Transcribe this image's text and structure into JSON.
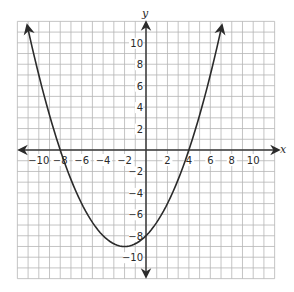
{
  "chart_data": {
    "type": "line",
    "title": "",
    "xlabel": "x",
    "ylabel": "y",
    "xlim": [
      -12,
      12
    ],
    "ylim": [
      -12,
      12
    ],
    "grid": true,
    "grid_step": 1,
    "x_ticks": [
      -10,
      -8,
      -6,
      -4,
      -2,
      2,
      4,
      6,
      8,
      10
    ],
    "y_ticks": [
      -10,
      -8,
      -6,
      -4,
      -2,
      2,
      4,
      6,
      8,
      10
    ],
    "x_tick_labels": [
      "−10",
      "−8",
      "−6",
      "−4",
      "−2",
      "2",
      "4",
      "6",
      "8",
      "10"
    ],
    "y_tick_labels": [
      "−10",
      "−8",
      "−6",
      "−4",
      "−2",
      "2",
      "4",
      "6",
      "8",
      "10"
    ],
    "series": [
      {
        "name": "parabola",
        "equation": "y = 0.25(x + 8)(x - 4)",
        "x_intercepts": [
          -8,
          4
        ],
        "y_intercept": -8,
        "vertex": [
          -2,
          -9
        ],
        "x": [
          -11.08,
          -10,
          -8,
          -6,
          -4,
          -2,
          0,
          2,
          4,
          6,
          7.08
        ],
        "values": [
          11.6,
          7,
          0,
          -5,
          -8,
          -9,
          -8,
          -5,
          0,
          7,
          11.6
        ],
        "arrows_both_ends": true
      }
    ],
    "legend": null
  },
  "colors": {
    "grid": "#b5b5b5",
    "axis": "#3a3a3a",
    "curve": "#2b2b2b",
    "background": "#ffffff"
  }
}
